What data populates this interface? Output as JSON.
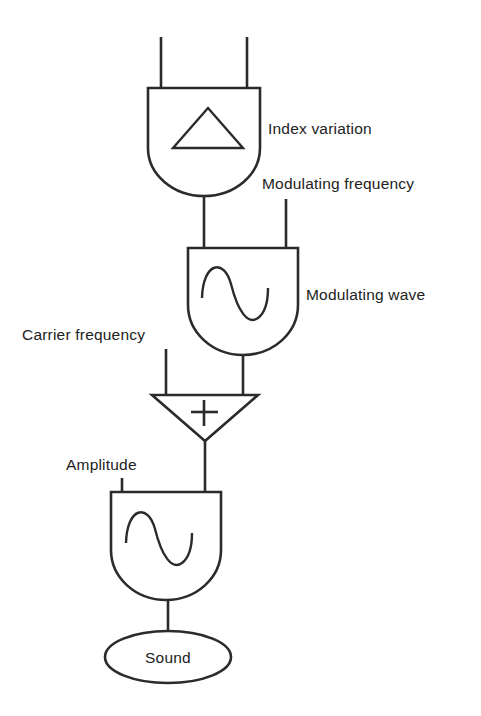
{
  "diagram": {
    "line_color": "#2b2b2b",
    "background_color": "#ffffff",
    "labels": {
      "index_variation": "Index variation",
      "modulating_frequency": "Modulating frequency",
      "modulating_wave": "Modulating wave",
      "carrier_frequency": "Carrier frequency",
      "amplitude": "Amplitude",
      "sound": "Sound",
      "adder_symbol": "+"
    },
    "nodes": [
      {
        "id": "envelope-generator",
        "shape": "u-module",
        "glyph": "triangle-envelope",
        "label": "Index variation",
        "inputs": 2
      },
      {
        "id": "modulator-oscillator",
        "shape": "u-module",
        "glyph": "sine-wave",
        "label": "Modulating wave",
        "inputs": 2
      },
      {
        "id": "summing-junction",
        "shape": "down-triangle",
        "glyph": "plus",
        "label": "+",
        "inputs": 2
      },
      {
        "id": "carrier-oscillator",
        "shape": "u-module",
        "glyph": "sine-wave",
        "label": "",
        "inputs": 2
      },
      {
        "id": "sound-output",
        "shape": "ellipse",
        "glyph": "none",
        "label": "Sound",
        "inputs": 1
      }
    ]
  }
}
